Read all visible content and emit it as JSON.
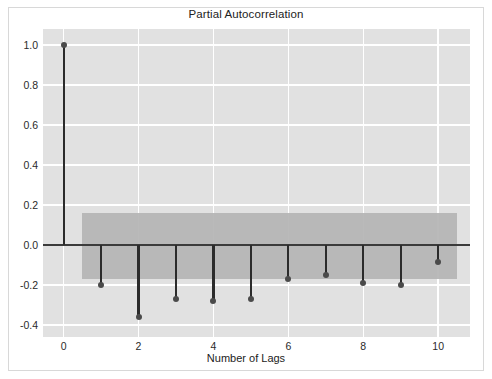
{
  "figure": {
    "width": 492,
    "height": 379,
    "background_color": "#ffffff",
    "axes_background_color": "#e1e1e1",
    "grid_color": "#ffffff",
    "stem_color": "#2b2b2b",
    "marker_color": "#4a4a4a",
    "zero_line_color": "#3b3b3b",
    "confidence_band_color": "#b4b4b4"
  },
  "chart_data": {
    "type": "bar",
    "plot_style": "stem",
    "title": "Partial Autocorrelation",
    "xlabel": "Number of Lags",
    "ylabel": "",
    "categories": [
      0,
      1,
      2,
      3,
      4,
      5,
      6,
      7,
      8,
      9,
      10
    ],
    "values": [
      1.0,
      -0.2,
      -0.36,
      -0.27,
      -0.28,
      -0.27,
      -0.17,
      -0.15,
      -0.19,
      -0.2,
      -0.085
    ],
    "series": [
      {
        "name": "Partial autocorrelation",
        "values": [
          1.0,
          -0.2,
          -0.36,
          -0.27,
          -0.28,
          -0.27,
          -0.17,
          -0.15,
          -0.19,
          -0.2,
          -0.085
        ]
      }
    ],
    "xlim": [
      -0.55,
      10.85
    ],
    "ylim": [
      -0.46,
      1.08
    ],
    "xticks": [
      0,
      2,
      4,
      6,
      8,
      10
    ],
    "xtick_labels": [
      "0",
      "2",
      "4",
      "6",
      "8",
      "10"
    ],
    "yticks": [
      1.0,
      0.8,
      0.6,
      0.4,
      0.2,
      0.0,
      -0.2,
      -0.4
    ],
    "ytick_labels": [
      "1.0",
      "0.8",
      "0.6",
      "0.4",
      "0.2",
      "0.0",
      "-0.2",
      "-0.4"
    ],
    "grid": true,
    "legend": null,
    "confidence_band": {
      "label": "95% confidence interval",
      "x_start": 0.5,
      "x_end": 10.5,
      "upper": 0.16,
      "lower": -0.17
    },
    "zero_line": 0.0
  }
}
